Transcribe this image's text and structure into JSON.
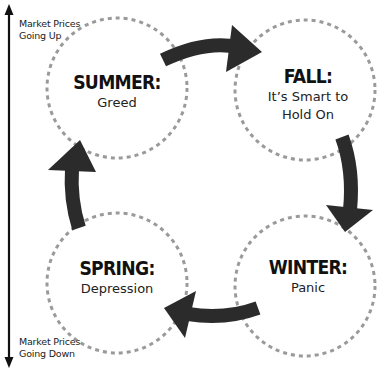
{
  "axis": {
    "top_label_line1": "Market Prices",
    "top_label_line2": "Going Up",
    "bottom_label_line1": "Market Prices",
    "bottom_label_line2": "Going Down"
  },
  "seasons": [
    {
      "name": "SUMMER:",
      "description": "Greed"
    },
    {
      "name": "FALL:",
      "description_line1": "It’s Smart to",
      "description_line2": "Hold On"
    },
    {
      "name": "WINTER:",
      "description": "Panic"
    },
    {
      "name": "SPRING:",
      "description": "Depression"
    }
  ],
  "cycle_order": [
    "SUMMER",
    "FALL",
    "WINTER",
    "SPRING"
  ],
  "colors": {
    "arrow": "#2b2b2b",
    "circle_dash": "#9a9a9a",
    "text": "#111111",
    "background": "#ffffff"
  }
}
